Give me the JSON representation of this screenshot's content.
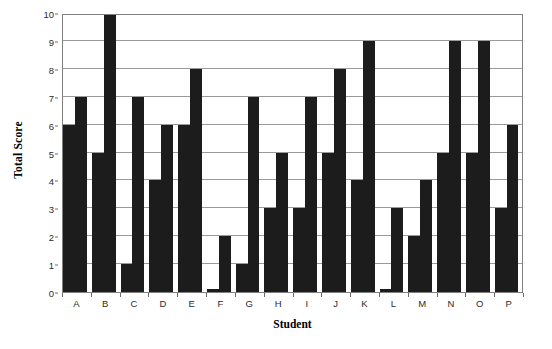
{
  "chart_data": {
    "type": "bar",
    "title": "",
    "xlabel": "Student",
    "ylabel": "Total Score",
    "categories": [
      "A",
      "B",
      "C",
      "D",
      "E",
      "F",
      "G",
      "H",
      "I",
      "J",
      "K",
      "L",
      "M",
      "N",
      "O",
      "P"
    ],
    "series": [
      {
        "name": "score-1",
        "values": [
          6,
          5,
          1,
          4,
          6,
          0.1,
          1,
          3,
          3,
          5,
          4,
          0.1,
          2,
          5,
          5,
          3
        ]
      },
      {
        "name": "score-2",
        "values": [
          7,
          10,
          7,
          6,
          8,
          2,
          7,
          5,
          7,
          8,
          9,
          3,
          4,
          9,
          9,
          6
        ]
      }
    ],
    "ylim": [
      0,
      10
    ],
    "yticks": [
      0,
      1,
      2,
      3,
      4,
      5,
      6,
      7,
      8,
      9,
      10
    ],
    "ytick_labels": [
      "0",
      "1",
      "2",
      "3",
      "4",
      "5",
      "6",
      "7",
      "8",
      "9",
      "10"
    ],
    "grid": true,
    "grid_axis": "y",
    "legend": false,
    "legend_position": "none",
    "bar_color": "#1c1c1c",
    "frame_color": "#808080",
    "gridline_color": "#9a9a9a",
    "background": "#ffffff"
  }
}
